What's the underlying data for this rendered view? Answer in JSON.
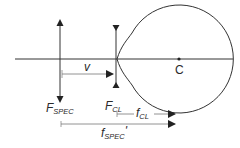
{
  "diagram": {
    "title": "",
    "labels": {
      "spectacle_focal_point": {
        "main": "F",
        "sub": "SPEC"
      },
      "contact_lens_focal_point": {
        "main": "F",
        "sub": "CL"
      },
      "vertex_distance": "v",
      "contact_lens_focal_length": {
        "main": "f",
        "sub": "CL"
      },
      "spectacle_focal_length_prime": {
        "main": "f",
        "sub": "SPEC",
        "suffix": "'"
      },
      "center_of_eye": "C"
    },
    "elements": [
      "optical-axis",
      "spectacle-lens (converging, double-headed arrow)",
      "contact-lens (diverging, inverted arrow heads)",
      "eye outline with cornea",
      "eye-center point C",
      "vertex distance arrow v",
      "f_CL arrow",
      "f_SPEC' arrow"
    ],
    "colors": {
      "line": "#333333",
      "dim_line": "#777777",
      "text": "#2a2a2a"
    }
  }
}
